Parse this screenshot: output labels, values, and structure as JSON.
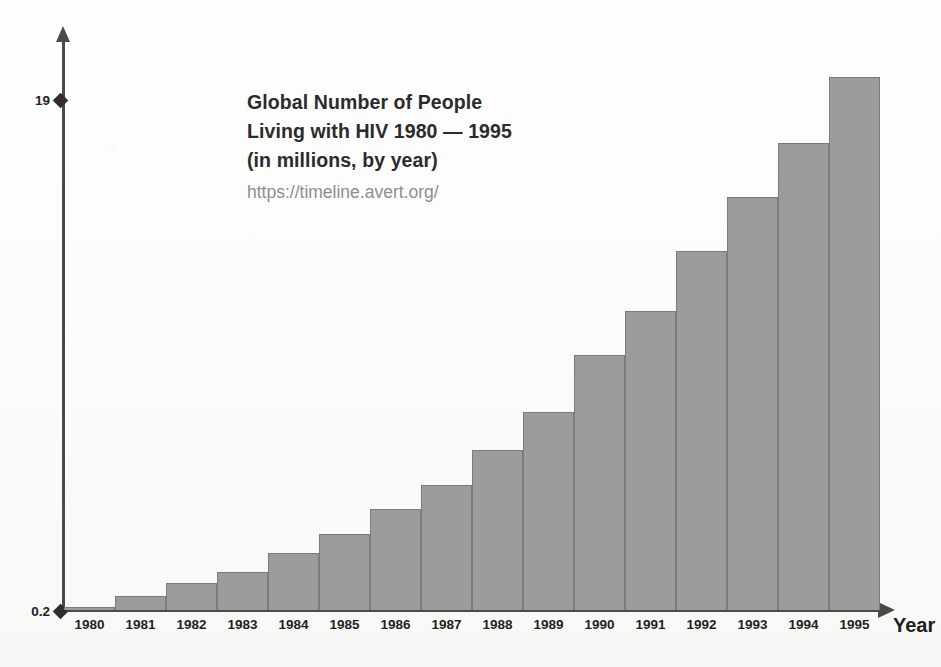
{
  "chart_data": {
    "type": "bar",
    "title": "Global Number of People Living with HIV 1980 — 1995 (in millions, by year)",
    "title_lines": [
      "Global Number of People",
      "Living with HIV 1980 — 1995",
      "(in millions, by year)"
    ],
    "source": "https://timeline.avert.org/",
    "xlabel": "Year",
    "ylabel": "",
    "categories": [
      "1980",
      "1981",
      "1982",
      "1983",
      "1984",
      "1985",
      "1986",
      "1987",
      "1988",
      "1989",
      "1990",
      "1991",
      "1992",
      "1993",
      "1994",
      "1995"
    ],
    "values": [
      0.3,
      0.7,
      1.2,
      1.6,
      2.3,
      3.0,
      3.9,
      4.8,
      6.1,
      7.5,
      9.6,
      11.2,
      13.4,
      15.4,
      17.4,
      19.8
    ],
    "ylim": [
      0.2,
      19.8
    ],
    "y_tick_labels": [
      "19",
      "0.2"
    ],
    "y_tick_top": "19",
    "y_tick_bottom": "0.2",
    "grid": false,
    "legend": false,
    "bar_color": "#9c9c9c",
    "bar_border_color": "#7b7b7b",
    "axis_color": "#4a4a4a",
    "background_color": "#fdfdfc"
  }
}
